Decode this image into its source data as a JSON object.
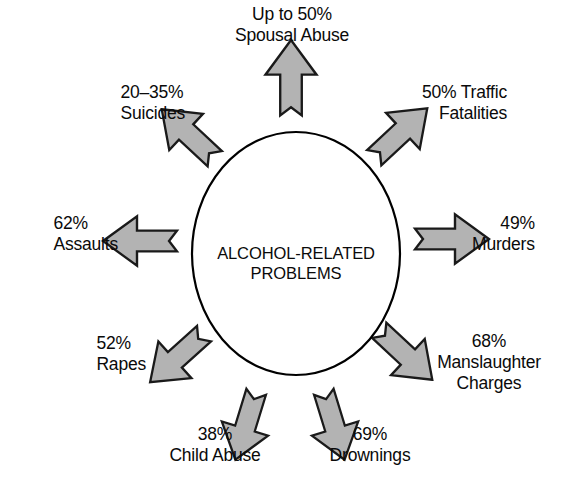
{
  "figure": {
    "title": "Alcohol-Related Problems",
    "center": {
      "line1": "ALCOHOL-RELATED",
      "line2": "PROBLEMS"
    },
    "colors": {
      "arrow_fill": "#b3b3b3",
      "arrow_stroke": "#1a1a1a",
      "circle_stroke": "#000000",
      "text": "#0a0a0a",
      "background": "#ffffff"
    },
    "spokes": [
      {
        "id": "spousal-abuse",
        "direction": "up",
        "angle_deg": -90,
        "percent": "Up to 50%",
        "category": "Spousal Abuse",
        "lines": [
          "Up to 50%",
          "Spousal Abuse"
        ]
      },
      {
        "id": "traffic-fatalities",
        "direction": "up-right",
        "angle_deg": -45,
        "percent": "50%",
        "category": "Traffic Fatalities",
        "lines": [
          "50% Traffic",
          "Fatalities"
        ]
      },
      {
        "id": "murders",
        "direction": "right",
        "angle_deg": 0,
        "percent": "49%",
        "category": "Murders",
        "lines": [
          "49%",
          "Murders"
        ]
      },
      {
        "id": "manslaughter-charges",
        "direction": "down-right",
        "angle_deg": 45,
        "percent": "68%",
        "category": "Manslaughter Charges",
        "lines": [
          "68%",
          "Manslaughter",
          "Charges"
        ]
      },
      {
        "id": "drownings",
        "direction": "down",
        "angle_deg": 70,
        "percent": "69%",
        "category": "Drownings",
        "lines": [
          "69%",
          "Drownings"
        ]
      },
      {
        "id": "child-abuse",
        "direction": "down",
        "angle_deg": 110,
        "percent": "38%",
        "category": "Child Abuse",
        "lines": [
          "38%",
          "Child Abuse"
        ]
      },
      {
        "id": "rapes",
        "direction": "down-left",
        "angle_deg": 135,
        "percent": "52%",
        "category": "Rapes",
        "lines": [
          "52%",
          "Rapes"
        ]
      },
      {
        "id": "assaults",
        "direction": "left",
        "angle_deg": 180,
        "percent": "62%",
        "category": "Assaults",
        "lines": [
          "62%",
          "Assaults"
        ]
      },
      {
        "id": "suicides",
        "direction": "up-left",
        "angle_deg": -135,
        "percent": "20–35%",
        "category": "Suicides",
        "lines": [
          "20–35%",
          "Suicides"
        ]
      }
    ]
  }
}
